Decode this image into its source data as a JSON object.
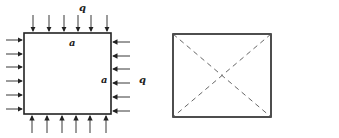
{
  "figure_left": {
    "load_label": "q",
    "side_label_top": "a",
    "side_label_right": "a",
    "right_load_label": "q"
  },
  "figure_right": {
    "description": "square with dashed diagonals"
  },
  "colors": {
    "stroke": "#222222",
    "dash": "#555555"
  }
}
